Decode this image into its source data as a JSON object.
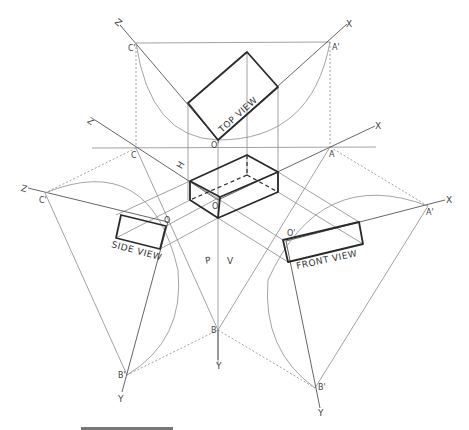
{
  "figure": {
    "views": {
      "top": "TOP VIEW",
      "side": "SIDE VIEW",
      "front": "FRONT VIEW"
    },
    "plane_labels": {
      "horizontal": "H",
      "profile": "P",
      "vertical": "V"
    },
    "axis_labels": {
      "z_top": "Z",
      "x_top": "X",
      "z_mid": "Z",
      "x_mid": "X",
      "z_left": "Z",
      "x_right": "X",
      "y_center": "Y",
      "y_left": "Y",
      "y_right": "Y"
    },
    "point_labels": {
      "c_prime_top": "C'",
      "a_prime_top": "A'",
      "o_prime_top": "O'",
      "c_mid": "C",
      "a_mid": "A",
      "o_center": "O",
      "c_prime_left": "C'",
      "o_left": "O",
      "a_prime_right": "A'",
      "o_prime_right": "O'",
      "b_center": "B",
      "b_prime_left": "B'",
      "b_prime_right": "B'"
    }
  }
}
